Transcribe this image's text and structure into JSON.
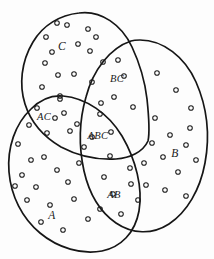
{
  "diagram": {
    "type": "venn",
    "background_color": "#fdfdfd",
    "stroke_color": "#161616",
    "dot_stroke_color": "#1c1c1c",
    "set_names": [
      "A",
      "B",
      "C"
    ],
    "regions": [
      {
        "id": "C",
        "label": "C",
        "x": 62,
        "y": 47,
        "dot_count": 13
      },
      {
        "id": "BC",
        "label": "BC",
        "x": 117,
        "y": 80,
        "dot_count": 7
      },
      {
        "id": "AC",
        "label": "AC",
        "x": 44,
        "y": 118,
        "dot_count": 7
      },
      {
        "id": "ABC",
        "label": "ABC",
        "x": 98,
        "y": 137,
        "dot_count": 6
      },
      {
        "id": "B",
        "label": "B",
        "x": 175,
        "y": 154,
        "dot_count": 14
      },
      {
        "id": "AB",
        "label": "AB",
        "x": 114,
        "y": 196,
        "dot_count": 8
      },
      {
        "id": "A",
        "label": "A",
        "x": 52,
        "y": 216,
        "dot_count": 15
      }
    ],
    "dots": {
      "C": [
        [
          57,
          23
        ],
        [
          67,
          25
        ],
        [
          88,
          29
        ],
        [
          46,
          37
        ],
        [
          90,
          51
        ],
        [
          45,
          63
        ],
        [
          58,
          75
        ],
        [
          74,
          74
        ],
        [
          42,
          87
        ],
        [
          60,
          96
        ],
        [
          78,
          44
        ],
        [
          96,
          37
        ],
        [
          52,
          52
        ]
      ],
      "BC": [
        [
          103,
          62
        ],
        [
          118,
          60
        ],
        [
          92,
          82
        ],
        [
          114,
          97
        ],
        [
          133,
          107
        ],
        [
          101,
          103
        ],
        [
          124,
          76
        ]
      ],
      "AC": [
        [
          60,
          99
        ],
        [
          37,
          108
        ],
        [
          55,
          118
        ],
        [
          47,
          133
        ],
        [
          70,
          131
        ],
        [
          29,
          125
        ],
        [
          64,
          113
        ]
      ],
      "ABC": [
        [
          77,
          124
        ],
        [
          100,
          114
        ],
        [
          111,
          132
        ],
        [
          84,
          147
        ],
        [
          110,
          156
        ],
        [
          92,
          137
        ]
      ],
      "B": [
        [
          157,
          73
        ],
        [
          176,
          90
        ],
        [
          191,
          108
        ],
        [
          155,
          118
        ],
        [
          170,
          135
        ],
        [
          186,
          145
        ],
        [
          163,
          157
        ],
        [
          178,
          172
        ],
        [
          196,
          160
        ],
        [
          152,
          143
        ],
        [
          190,
          128
        ],
        [
          165,
          190
        ],
        [
          186,
          196
        ],
        [
          144,
          163
        ]
      ],
      "AB": [
        [
          130,
          168
        ],
        [
          104,
          177
        ],
        [
          131,
          184
        ],
        [
          113,
          194
        ],
        [
          138,
          200
        ],
        [
          100,
          209
        ],
        [
          121,
          214
        ],
        [
          146,
          185
        ]
      ],
      "A": [
        [
          18,
          144
        ],
        [
          31,
          160
        ],
        [
          22,
          175
        ],
        [
          44,
          157
        ],
        [
          57,
          170
        ],
        [
          36,
          187
        ],
        [
          68,
          182
        ],
        [
          27,
          200
        ],
        [
          50,
          205
        ],
        [
          74,
          199
        ],
        [
          41,
          222
        ],
        [
          63,
          230
        ],
        [
          88,
          219
        ],
        [
          15,
          186
        ],
        [
          79,
          163
        ]
      ]
    }
  }
}
